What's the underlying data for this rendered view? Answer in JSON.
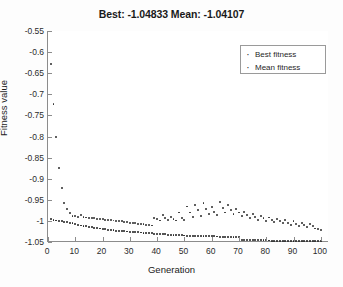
{
  "chart_data": {
    "type": "scatter",
    "title": "Best: -1.04833 Mean: -1.04107",
    "xlabel": "Generation",
    "ylabel": "Fitness value",
    "xlim": [
      0,
      103
    ],
    "ylim": [
      -1.05,
      -0.55
    ],
    "grid": false,
    "legend_position": "top-right",
    "xticks": [
      0,
      10,
      20,
      30,
      40,
      50,
      60,
      70,
      80,
      90,
      100
    ],
    "xtick_labels": [
      "0",
      "10",
      "20",
      "30",
      "40",
      "50",
      "60",
      "70",
      "80",
      "90",
      "100"
    ],
    "yticks": [
      -0.55,
      -0.6,
      -0.65,
      -0.7,
      -0.75,
      -0.8,
      -0.85,
      -0.9,
      -0.95,
      -1,
      -1.05
    ],
    "ytick_labels": [
      "-0.55",
      "-0.6",
      "-0.65",
      "-0.7",
      "-0.75",
      "-0.8",
      "-0.85",
      "-0.9",
      "-0.95",
      "-1",
      "-1.05"
    ],
    "series": [
      {
        "name": "Best fitness",
        "marker": "dot",
        "color": "#1f1f1f",
        "x": [
          1,
          2,
          3,
          4,
          5,
          6,
          7,
          8,
          9,
          10,
          11,
          12,
          13,
          14,
          15,
          16,
          17,
          18,
          19,
          20,
          21,
          22,
          23,
          24,
          25,
          26,
          27,
          28,
          29,
          30,
          31,
          32,
          33,
          34,
          35,
          36,
          37,
          38,
          39,
          40,
          41,
          42,
          43,
          44,
          45,
          46,
          47,
          48,
          49,
          50,
          51,
          52,
          53,
          54,
          55,
          56,
          57,
          58,
          59,
          60,
          61,
          62,
          63,
          64,
          65,
          66,
          67,
          68,
          69,
          70,
          71,
          72,
          73,
          74,
          75,
          76,
          77,
          78,
          79,
          80,
          81,
          82,
          83,
          84,
          85,
          86,
          87,
          88,
          89,
          90,
          91,
          92,
          93,
          94,
          95,
          96,
          97,
          98,
          99,
          100
        ],
        "values": [
          -0.996,
          -0.998,
          -0.999,
          -1.0,
          -1.001,
          -1.002,
          -1.003,
          -1.004,
          -1.006,
          -1.008,
          -1.009,
          -1.011,
          -1.012,
          -1.013,
          -1.014,
          -1.015,
          -1.016,
          -1.017,
          -1.018,
          -1.019,
          -1.02,
          -1.021,
          -1.022,
          -1.0225,
          -1.023,
          -1.0235,
          -1.024,
          -1.0245,
          -1.025,
          -1.0255,
          -1.026,
          -1.0265,
          -1.027,
          -1.0275,
          -1.028,
          -1.0285,
          -1.029,
          -1.0295,
          -1.03,
          -1.0305,
          -1.031,
          -1.0315,
          -1.032,
          -1.0325,
          -1.033,
          -1.0335,
          -1.034,
          -1.0342,
          -1.0344,
          -1.0346,
          -1.0348,
          -1.035,
          -1.0352,
          -1.0354,
          -1.0356,
          -1.0358,
          -1.036,
          -1.0362,
          -1.0364,
          -1.0366,
          -1.0368,
          -1.037,
          -1.0372,
          -1.0374,
          -1.0376,
          -1.0378,
          -1.038,
          -1.0382,
          -1.0384,
          -1.0386,
          -1.0444,
          -1.0446,
          -1.0448,
          -1.045,
          -1.0452,
          -1.0454,
          -1.0456,
          -1.0458,
          -1.046,
          -1.0462,
          -1.0464,
          -1.0466,
          -1.0468,
          -1.047,
          -1.0471,
          -1.0472,
          -1.0473,
          -1.0474,
          -1.0475,
          -1.0476,
          -1.0477,
          -1.0478,
          -1.0479,
          -1.048,
          -1.0481,
          -1.0482,
          -1.04825,
          -1.0483,
          -1.04832,
          -1.04833
        ]
      },
      {
        "name": "Mean fitness",
        "marker": "dot",
        "color": "#2e2e2e",
        "x": [
          1,
          2,
          3,
          4,
          5,
          6,
          7,
          8,
          9,
          10,
          11,
          12,
          13,
          14,
          15,
          16,
          17,
          18,
          19,
          20,
          21,
          22,
          23,
          24,
          25,
          26,
          27,
          28,
          29,
          30,
          31,
          32,
          33,
          34,
          35,
          36,
          37,
          38,
          39,
          40,
          41,
          42,
          43,
          44,
          45,
          46,
          47,
          48,
          49,
          50,
          51,
          52,
          53,
          54,
          55,
          56,
          57,
          58,
          59,
          60,
          61,
          62,
          63,
          64,
          65,
          66,
          67,
          68,
          69,
          70,
          71,
          72,
          73,
          74,
          75,
          76,
          77,
          78,
          79,
          80,
          81,
          82,
          83,
          84,
          85,
          86,
          87,
          88,
          89,
          90,
          91,
          92,
          93,
          94,
          95,
          96,
          97,
          98,
          99,
          100
        ],
        "values": [
          -0.628,
          -0.722,
          -0.802,
          -0.875,
          -0.923,
          -0.958,
          -0.972,
          -0.982,
          -0.988,
          -0.988,
          -0.99,
          -0.986,
          -0.991,
          -0.992,
          -0.993,
          -0.993,
          -0.994,
          -0.995,
          -0.995,
          -0.996,
          -0.997,
          -0.997,
          -0.998,
          -0.999,
          -1.0,
          -1.0,
          -1.001,
          -1.002,
          -1.003,
          -1.004,
          -1.005,
          -1.006,
          -1.007,
          -1.008,
          -1.008,
          -1.009,
          -1.01,
          -1.011,
          -0.993,
          -0.996,
          -0.999,
          -0.985,
          -0.993,
          -0.998,
          -0.99,
          -0.996,
          -0.999,
          -0.98,
          -0.993,
          -0.998,
          -0.966,
          -0.98,
          -0.99,
          -0.962,
          -0.975,
          -0.988,
          -0.958,
          -0.972,
          -0.984,
          -0.967,
          -0.978,
          -0.986,
          -0.955,
          -0.97,
          -0.98,
          -0.962,
          -0.974,
          -0.983,
          -0.971,
          -0.98,
          -0.988,
          -0.978,
          -0.986,
          -0.993,
          -0.983,
          -0.99,
          -0.997,
          -0.988,
          -0.994,
          -1.0,
          -0.992,
          -0.998,
          -1.003,
          -0.995,
          -1.001,
          -1.006,
          -0.998,
          -1.004,
          -1.009,
          -1.001,
          -1.007,
          -1.012,
          -1.004,
          -1.01,
          -1.015,
          -1.007,
          -1.013,
          -1.018,
          -1.02,
          -1.022
        ]
      }
    ]
  },
  "legend": {
    "marker_glyph": "·",
    "entries": [
      {
        "label": "Best fitness"
      },
      {
        "label": "Mean fitness"
      }
    ]
  }
}
